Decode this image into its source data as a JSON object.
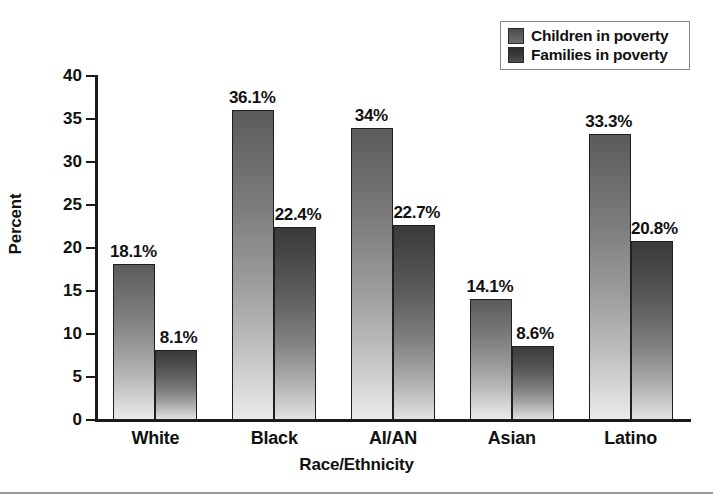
{
  "chart_data": {
    "type": "bar",
    "title": "",
    "xlabel": "Race/Ethnicity",
    "ylabel": "Percent",
    "ylim": [
      0,
      40
    ],
    "yticks": [
      0,
      5,
      10,
      15,
      20,
      25,
      30,
      35,
      40
    ],
    "ytick_labels": [
      "0",
      "5",
      "10",
      "15",
      "20",
      "25",
      "30",
      "35",
      "40"
    ],
    "grid": false,
    "legend_position": "top-right",
    "categories": [
      "White",
      "Black",
      "AI/AN",
      "Asian",
      "Latino"
    ],
    "series": [
      {
        "name": "Children in poverty",
        "color": "#6a6a6a",
        "values": [
          18.1,
          36.1,
          34.0,
          14.1,
          33.3
        ],
        "labels": [
          "18.1%",
          "36.1%",
          "34%",
          "14.1%",
          "33.3%"
        ]
      },
      {
        "name": "Families in poverty",
        "color": "#474747",
        "values": [
          8.1,
          22.4,
          22.7,
          8.6,
          20.8
        ],
        "labels": [
          "8.1%",
          "22.4%",
          "22.7%",
          "8.6%",
          "20.8%"
        ]
      }
    ]
  },
  "legend": {
    "entries": [
      {
        "label": "Children in poverty",
        "swatch": "series-a"
      },
      {
        "label": "Families in poverty",
        "swatch": "series-b"
      }
    ]
  },
  "colors": {
    "axis": "#1a1a1a",
    "text": "#111111",
    "legend_border": "#8a8a8a",
    "bottom_rule": "#9a9a9a",
    "series_a": "#6a6a6a",
    "series_b": "#474747"
  }
}
